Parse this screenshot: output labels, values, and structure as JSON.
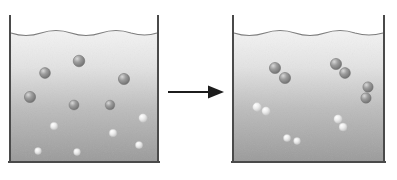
{
  "figure": {
    "background_color": "#ffffff"
  },
  "colors": {
    "glass_wall": "#4a4a4a",
    "liquid_top": "#f2f2f2",
    "liquid_bottom": "#9a9a9a",
    "meniscus_line": "#7d7d7d",
    "particle_dark": "#8c8c8c",
    "particle_dark_edge": "#6a6a6a",
    "particle_light": "#e8e8e8",
    "particle_light_edge": "#bdbdbd",
    "arrow": "#1c1c1c"
  },
  "left_beaker": {
    "label": "reactant-beaker",
    "caption": "",
    "geometry": {
      "x": 9,
      "y": 16,
      "width": 150,
      "height": 147,
      "wall_thickness": 2
    },
    "liquid": {
      "surface_y": 33,
      "bottom_y": 161,
      "wave_amplitude": 3,
      "wave_count": 5
    },
    "particle_count": 12,
    "particles": [
      {
        "cx": 45,
        "cy": 73,
        "r": 5.4,
        "shade": "dark"
      },
      {
        "cx": 79,
        "cy": 61,
        "r": 5.8,
        "shade": "dark"
      },
      {
        "cx": 124,
        "cy": 79,
        "r": 5.6,
        "shade": "dark"
      },
      {
        "cx": 30,
        "cy": 97,
        "r": 5.6,
        "shade": "dark"
      },
      {
        "cx": 74,
        "cy": 105,
        "r": 5.0,
        "shade": "dark"
      },
      {
        "cx": 110,
        "cy": 105,
        "r": 4.8,
        "shade": "dark"
      },
      {
        "cx": 143,
        "cy": 118,
        "r": 4.2,
        "shade": "light"
      },
      {
        "cx": 54,
        "cy": 126,
        "r": 3.8,
        "shade": "light"
      },
      {
        "cx": 113,
        "cy": 133,
        "r": 3.8,
        "shade": "light"
      },
      {
        "cx": 139,
        "cy": 145,
        "r": 3.6,
        "shade": "light"
      },
      {
        "cx": 38,
        "cy": 151,
        "r": 3.4,
        "shade": "light"
      },
      {
        "cx": 77,
        "cy": 152,
        "r": 3.4,
        "shade": "light"
      }
    ]
  },
  "right_beaker": {
    "label": "product-beaker",
    "caption": "",
    "geometry": {
      "x": 232,
      "y": 16,
      "width": 153,
      "height": 147,
      "wall_thickness": 2
    },
    "liquid": {
      "surface_y": 33,
      "bottom_y": 161,
      "wave_amplitude": 3,
      "wave_count": 5
    },
    "pair_count": 6,
    "pairs": [
      {
        "name": "pair-1",
        "a": {
          "cx": 275,
          "cy": 68,
          "r": 5.6
        },
        "b": {
          "cx": 285,
          "cy": 78,
          "r": 5.6
        },
        "shade": "dark"
      },
      {
        "name": "pair-2",
        "a": {
          "cx": 336,
          "cy": 64,
          "r": 5.6
        },
        "b": {
          "cx": 345,
          "cy": 72,
          "r": 5.4
        },
        "shade": "dark"
      },
      {
        "name": "pair-3",
        "a": {
          "cx": 368,
          "cy": 87,
          "r": 5.2
        },
        "b": {
          "cx": 366,
          "cy": 98,
          "r": 5.2
        },
        "shade": "dark"
      },
      {
        "name": "pair-4",
        "a": {
          "cx": 257,
          "cy": 107,
          "r": 4.4,
          "shade": "light"
        },
        "b": {
          "cx": 266,
          "cy": 111,
          "r": 4.2
        },
        "shade": "light"
      },
      {
        "cx": 0,
        "name": "pair-5",
        "a": {
          "cx": 338,
          "cy": 119,
          "r": 4.2
        },
        "b": {
          "cx": 343,
          "cy": 127,
          "r": 4.0
        },
        "shade": "light"
      },
      {
        "name": "pair-6",
        "a": {
          "cx": 287,
          "cy": 138,
          "r": 3.6
        },
        "b": {
          "cx": 297,
          "cy": 141,
          "r": 3.4
        },
        "shade": "light"
      }
    ]
  },
  "arrow": {
    "label": "reaction-arrow",
    "text": "",
    "direction": "right",
    "x1": 170,
    "x2": 224,
    "y": 92,
    "line_width": 2,
    "head_length": 12,
    "head_width": 13
  }
}
